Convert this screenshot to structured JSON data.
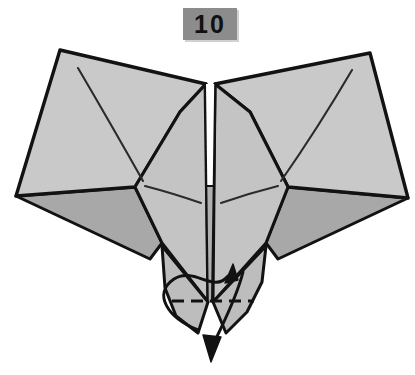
{
  "figure": {
    "step_badge": {
      "label": "10",
      "box_color": "#8c8c8c",
      "text_color": "#111111"
    },
    "colors": {
      "paper_light": "#c9c9c9",
      "paper_mid": "#bdbdbd",
      "paper_dark": "#a8a8a8",
      "paper_white": "#ffffff",
      "outline": "#121212",
      "crease": "#2b2b2b",
      "background": "#ffffff"
    },
    "canvas": {
      "width": 415,
      "height": 375
    },
    "shapes": {
      "left_wing_upper": "60,50 207,83 180,112 135,186 16,195",
      "right_wing_upper": "370,53 223,83 250,112 288,186 408,197",
      "left_wing_lower": "16,196 135,187 160,240 150,258",
      "right_wing_lower": "408,198 288,187 268,240 278,258",
      "body_left": "207,85 180,112 135,186 160,240 207,300",
      "body_right": "214,85 250,112 288,186 268,240 214,300",
      "center_strip_white": "205,85 214,85 214,186 205,186",
      "center_strip_gray": "206,186 213,186 212,300 207,300",
      "tail_left": "160,245 207,300 195,330 175,315",
      "tail_right": "268,245 214,300 228,330 248,318"
    },
    "creases": [
      {
        "name": "left-wing-diagonal",
        "from": "78,68",
        "to": "143,180"
      },
      {
        "name": "right-wing-diagonal",
        "from": "352,70",
        "to": "281,180"
      },
      {
        "name": "left-body-crease",
        "from": "145,186",
        "to": "201,202"
      },
      {
        "name": "right-body-crease",
        "from": "278,186",
        "to": "221,202"
      }
    ],
    "fold_line": {
      "name": "valley-fold-dashed",
      "style": "dashed",
      "from": "172,301",
      "to": "254,301"
    },
    "arrows": [
      {
        "name": "fold-up-arrow",
        "direction": "up-right",
        "tip": "232,266"
      },
      {
        "name": "fold-down-arrow",
        "direction": "down",
        "tip": "212,360"
      }
    ]
  }
}
